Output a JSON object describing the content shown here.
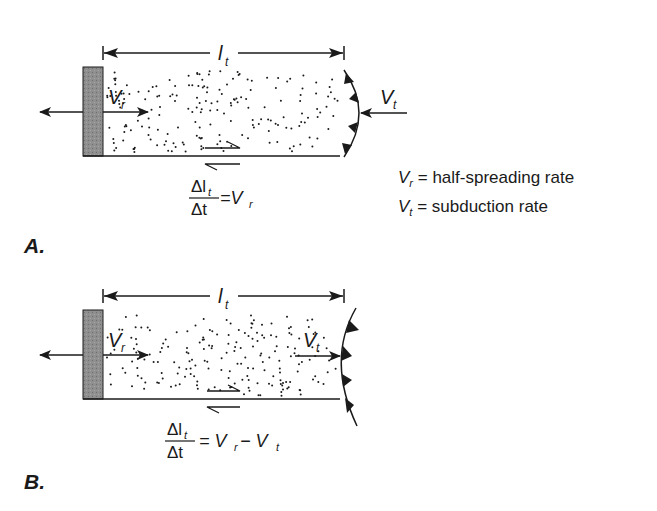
{
  "figure": {
    "panels": [
      {
        "id": "A",
        "label": "A.",
        "dimension_label": {
          "symbol": "l",
          "subscript": "t"
        },
        "ridge_velocity_label": {
          "symbol": "V",
          "subscript": "r"
        },
        "trench_velocity_label": {
          "symbol": "V",
          "subscript": "t"
        },
        "trench_velocity_direction": "toward ridge (leftward)",
        "equation": {
          "numerator": "Δl",
          "numerator_sub": "t",
          "denominator": "Δt",
          "rhs": "=V",
          "rhs_sub": "r"
        }
      },
      {
        "id": "B",
        "label": "B.",
        "dimension_label": {
          "symbol": "l",
          "subscript": "t"
        },
        "ridge_velocity_label": {
          "symbol": "V",
          "subscript": "r"
        },
        "trench_velocity_label": {
          "symbol": "V",
          "subscript": "t"
        },
        "trench_velocity_direction": "away from ridge (rightward)",
        "equation": {
          "numerator": "Δl",
          "numerator_sub": "t",
          "denominator": "Δt",
          "rhs": "= V",
          "rhs_sub": "r",
          "rhs_mid": " − V",
          "rhs_sub2": "t"
        }
      }
    ],
    "legend": [
      {
        "symbol": "V",
        "subscript": "r",
        "text": " = half-spreading rate"
      },
      {
        "symbol": "V",
        "subscript": "t",
        "text": " = subduction rate"
      }
    ],
    "colors": {
      "ink": "#1a1a1a",
      "ridge_fill": "#8c8c8c",
      "background": "#ffffff"
    }
  }
}
